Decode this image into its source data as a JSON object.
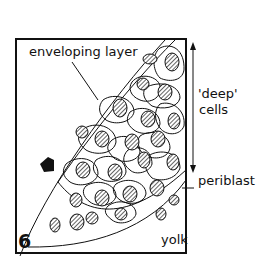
{
  "figure": {
    "panel_number": "6",
    "labels": {
      "enveloping_layer": "enveloping layer",
      "deep_line1": "'deep'",
      "deep_line2": "cells",
      "periblast": "periblast",
      "yolk": "yolk"
    },
    "colors": {
      "ink": "#111111",
      "background": "#ffffff"
    }
  }
}
